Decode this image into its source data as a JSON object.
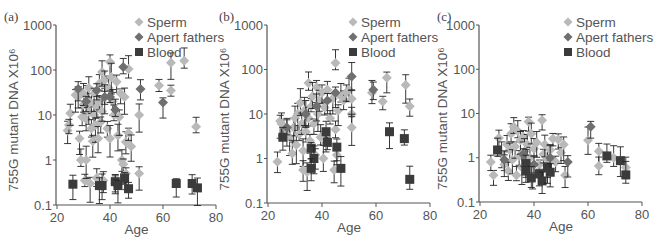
{
  "figure": {
    "panels": [
      "(a)",
      "(b)",
      "(c)"
    ],
    "ylabel": "755G mutant DNA X10⁶",
    "xlabel": "Age"
  },
  "legend": {
    "items": [
      {
        "label": "Sperm",
        "marker": "diamond",
        "color": "#b9b9b9"
      },
      {
        "label": "Apert fathers",
        "marker": "diamond",
        "color": "#6f6f6f"
      },
      {
        "label": "Blood",
        "marker": "square",
        "color": "#3b3b3b"
      }
    ]
  },
  "chart_data": [
    {
      "type": "scatter",
      "panel": "(a)",
      "title": "",
      "xlabel": "Age",
      "ylabel": "755G mutant DNA X10⁶",
      "xlim": [
        20,
        80
      ],
      "ylim": [
        0.1,
        1000
      ],
      "yscale": "log",
      "xticks": [
        20,
        40,
        60,
        80
      ],
      "yticks": [
        0.1,
        1,
        10,
        100,
        1000
      ],
      "ytick_labels": [
        "0.1",
        "1",
        "10",
        "100",
        "1000"
      ],
      "grid": false,
      "legend_position": "top-right",
      "series": [
        {
          "name": "Sperm",
          "points": [
            [
              24,
              4.5
            ],
            [
              24.5,
              6
            ],
            [
              25,
              11
            ],
            [
              27,
              28
            ],
            [
              28,
              25
            ],
            [
              28.5,
              3
            ],
            [
              29,
              1
            ],
            [
              29.5,
              9
            ],
            [
              30,
              17
            ],
            [
              30,
              30
            ],
            [
              30.5,
              0.35
            ],
            [
              31,
              1
            ],
            [
              31,
              8
            ],
            [
              31.5,
              22
            ],
            [
              32,
              12
            ],
            [
              32,
              40
            ],
            [
              32.5,
              0.3
            ],
            [
              33,
              5
            ],
            [
              33,
              18
            ],
            [
              33.5,
              2.6
            ],
            [
              34,
              10
            ],
            [
              34,
              30
            ],
            [
              34.5,
              6
            ],
            [
              35,
              0.4
            ],
            [
              35,
              15
            ],
            [
              35.5,
              3
            ],
            [
              36,
              20
            ],
            [
              36,
              50
            ],
            [
              36.5,
              7
            ],
            [
              37,
              90
            ],
            [
              37,
              12
            ],
            [
              37.5,
              0.35
            ],
            [
              38,
              25
            ],
            [
              38,
              60
            ],
            [
              39,
              5
            ],
            [
              39.5,
              40
            ],
            [
              40,
              150
            ],
            [
              40,
              3
            ],
            [
              40.5,
              70
            ],
            [
              41,
              20
            ],
            [
              41.5,
              10
            ],
            [
              42,
              0.3
            ],
            [
              42.5,
              55
            ],
            [
              43,
              3.5
            ],
            [
              43.5,
              9
            ],
            [
              44,
              30
            ],
            [
              44.5,
              1
            ],
            [
              45,
              0.8
            ],
            [
              45.5,
              25
            ],
            [
              46,
              2.5
            ],
            [
              46,
              0.5
            ],
            [
              47,
              105
            ],
            [
              47,
              4
            ],
            [
              48,
              2
            ],
            [
              51,
              10
            ],
            [
              51,
              0.5
            ],
            [
              58.5,
              45
            ],
            [
              63,
              35
            ],
            [
              63,
              145
            ],
            [
              68,
              160
            ],
            [
              72.5,
              5.5
            ]
          ]
        },
        {
          "name": "Apert fathers",
          "points": [
            [
              28,
              38
            ],
            [
              31,
              20
            ],
            [
              35,
              35
            ],
            [
              38,
              25
            ],
            [
              40,
              25
            ],
            [
              42,
              13
            ],
            [
              45,
              117
            ],
            [
              51.5,
              38
            ],
            [
              60,
              19
            ]
          ]
        },
        {
          "name": "Blood",
          "points": [
            [
              26,
              0.29
            ],
            [
              36,
              0.27
            ],
            [
              37,
              0.27
            ],
            [
              42,
              0.33
            ],
            [
              43,
              0.27
            ],
            [
              45.5,
              0.4
            ],
            [
              47,
              0.23
            ],
            [
              65,
              0.3
            ],
            [
              71,
              0.3
            ],
            [
              73,
              0.24
            ]
          ]
        }
      ]
    },
    {
      "type": "scatter",
      "panel": "(b)",
      "title": "",
      "xlabel": "Age",
      "ylabel": "755G mutant DNA X10⁶",
      "xlim": [
        20,
        80
      ],
      "ylim": [
        0.1,
        1000
      ],
      "yscale": "log",
      "xticks": [
        20,
        40,
        60,
        80
      ],
      "yticks": [
        0.1,
        1,
        10,
        100,
        1000
      ],
      "ytick_labels": [
        "0.1",
        "1",
        "10",
        "100",
        "1000"
      ],
      "grid": false,
      "legend_position": "top-right",
      "series": [
        {
          "name": "Sperm",
          "points": [
            [
              23.5,
              0.85
            ],
            [
              24.5,
              7
            ],
            [
              25,
              6
            ],
            [
              27,
              4
            ],
            [
              28,
              3
            ],
            [
              29,
              1.3
            ],
            [
              29.5,
              5
            ],
            [
              30,
              8
            ],
            [
              30.5,
              2
            ],
            [
              31,
              10
            ],
            [
              31.5,
              3.5
            ],
            [
              32,
              18
            ],
            [
              32.5,
              6
            ],
            [
              33,
              1.5
            ],
            [
              33,
              0.55
            ],
            [
              33.5,
              12
            ],
            [
              34,
              4
            ],
            [
              34.5,
              0.5
            ],
            [
              35,
              50
            ],
            [
              35,
              8
            ],
            [
              35.5,
              2.5
            ],
            [
              36,
              15
            ],
            [
              36.5,
              25
            ],
            [
              37,
              6
            ],
            [
              37.5,
              1.2
            ],
            [
              38,
              40
            ],
            [
              38.5,
              10
            ],
            [
              39,
              20
            ],
            [
              39.5,
              3
            ],
            [
              40,
              30
            ],
            [
              40.5,
              1
            ],
            [
              41,
              14
            ],
            [
              41.5,
              2.2
            ],
            [
              42,
              35
            ],
            [
              43,
              8
            ],
            [
              44,
              22
            ],
            [
              44.5,
              0.55
            ],
            [
              45,
              140
            ],
            [
              45,
              4.5
            ],
            [
              45.5,
              1.2
            ],
            [
              46,
              12
            ],
            [
              47,
              25
            ],
            [
              48,
              20
            ],
            [
              49,
              30
            ],
            [
              50,
              35
            ],
            [
              51,
              10
            ],
            [
              51,
              5
            ],
            [
              51,
              22
            ],
            [
              58.5,
              30
            ],
            [
              62.5,
              19
            ],
            [
              64,
              65
            ],
            [
              71,
              45
            ],
            [
              72.5,
              15
            ]
          ]
        },
        {
          "name": "Apert fathers",
          "points": [
            [
              27,
              5
            ],
            [
              34,
              10
            ],
            [
              38,
              15
            ],
            [
              42,
              20
            ],
            [
              45,
              30
            ],
            [
              51,
              70
            ],
            [
              59,
              35
            ]
          ]
        },
        {
          "name": "Blood",
          "points": [
            [
              25.5,
              3
            ],
            [
              36,
              1.7
            ],
            [
              37,
              1.0
            ],
            [
              36,
              0.6
            ],
            [
              41.5,
              4
            ],
            [
              42,
              2.3
            ],
            [
              45.5,
              1.8
            ],
            [
              47,
              0.6
            ],
            [
              65,
              4
            ],
            [
              70.5,
              2.8
            ],
            [
              72.5,
              0.34
            ]
          ]
        }
      ]
    },
    {
      "type": "scatter",
      "panel": "(c)",
      "title": "",
      "xlabel": "Age",
      "ylabel": "755G mutant DNA X10⁶",
      "xlim": [
        20,
        80
      ],
      "ylim": [
        0.1,
        1000
      ],
      "yscale": "log",
      "xticks": [
        20,
        40,
        60,
        80
      ],
      "yticks": [
        0.1,
        1,
        10,
        100,
        1000
      ],
      "ytick_labels": [
        "0.1",
        "1",
        "10",
        "100",
        "1000"
      ],
      "grid": false,
      "legend_position": "top-right",
      "series": [
        {
          "name": "Sperm",
          "points": [
            [
              24,
              0.8
            ],
            [
              25,
              0.4
            ],
            [
              27,
              2.8
            ],
            [
              28,
              1.2
            ],
            [
              29,
              0.7
            ],
            [
              30,
              2
            ],
            [
              30.5,
              0.5
            ],
            [
              31,
              1.5
            ],
            [
              31.5,
              3.5
            ],
            [
              32,
              0.9
            ],
            [
              32.5,
              5
            ],
            [
              33,
              1.8
            ],
            [
              33.5,
              0.4
            ],
            [
              34,
              4
            ],
            [
              34.5,
              1.1
            ],
            [
              35,
              2.5
            ],
            [
              35.5,
              0.6
            ],
            [
              36,
              3
            ],
            [
              36.5,
              1.4
            ],
            [
              37,
              0.8
            ],
            [
              37.5,
              2
            ],
            [
              38,
              6.5
            ],
            [
              38.5,
              1
            ],
            [
              39,
              3.5
            ],
            [
              39.5,
              0.5
            ],
            [
              40,
              1.6
            ],
            [
              41,
              2.2
            ],
            [
              42,
              0.7
            ],
            [
              43,
              7
            ],
            [
              43.5,
              1.2
            ],
            [
              44,
              2
            ],
            [
              45,
              0.9
            ],
            [
              46,
              1.5
            ],
            [
              47,
              2.7
            ],
            [
              48,
              0.8
            ],
            [
              49,
              2.6
            ],
            [
              50,
              1.3
            ],
            [
              51,
              2
            ],
            [
              51.5,
              0.4
            ],
            [
              60,
              2.5
            ],
            [
              64,
              1.4
            ],
            [
              64,
              0.65
            ],
            [
              69.5,
              1.0
            ],
            [
              74,
              0.6
            ]
          ]
        },
        {
          "name": "Apert fathers",
          "points": [
            [
              29,
              0.9
            ],
            [
              36,
              1.2
            ],
            [
              40,
              0.7
            ],
            [
              46,
              1.0
            ],
            [
              52.5,
              0.8
            ],
            [
              61,
              5
            ]
          ]
        },
        {
          "name": "Blood",
          "points": [
            [
              26.5,
              1.5
            ],
            [
              37,
              0.74
            ],
            [
              37,
              0.5
            ],
            [
              39,
              0.35
            ],
            [
              42,
              0.43
            ],
            [
              43,
              0.3
            ],
            [
              45,
              0.6
            ],
            [
              46,
              0.47
            ],
            [
              67,
              1.1
            ],
            [
              72,
              0.86
            ],
            [
              74,
              0.41
            ]
          ]
        }
      ]
    }
  ]
}
